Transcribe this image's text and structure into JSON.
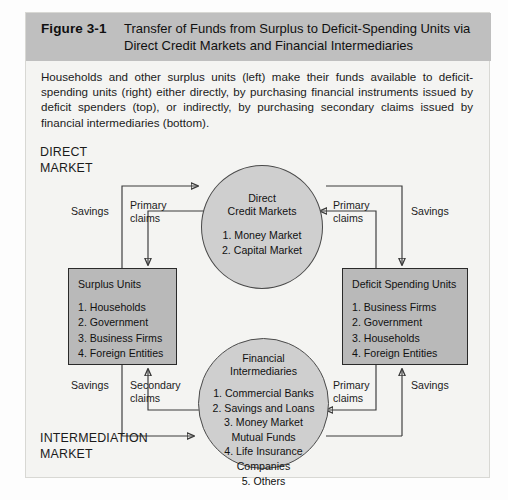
{
  "figure": {
    "label": "Figure 3-1",
    "title": "Transfer of Funds from Surplus to Deficit-Spending Units via Direct Credit Markets and Financial Intermediaries",
    "caption": "Households and other surplus units (left) make their funds available to deficit-spending units (right) either directly, by purchasing financial instruments issued by deficit spenders (top), or indirectly, by purchasing secondary claims issued by financial intermediaries (bottom)."
  },
  "colors": {
    "header_band": "#bfbfbf",
    "panel_background": "#f4f4f2",
    "box_fill": "#b9b9b9",
    "circle_fill": "#cfcfcf",
    "stroke": "#3a3a3a"
  },
  "diagram": {
    "markets": {
      "direct": "DIRECT\nMARKET",
      "intermediation": "INTERMEDIATION\nMARKET"
    },
    "nodes": {
      "direct_credit_markets": {
        "title": "Direct\nCredit Markets",
        "items": "1. Money Market\n2. Capital Market"
      },
      "financial_intermediaries": {
        "title": "Financial\nIntermediaries",
        "items": "1. Commercial Banks\n2. Savings and Loans\n3. Money Market\nMutual Funds\n4. Life Insurance\nCompanies\n5. Others"
      },
      "surplus_units": {
        "title": "Surplus Units",
        "items": "1. Households\n2. Government\n3. Business Firms\n4. Foreign Entities"
      },
      "deficit_spending_units": {
        "title": "Deficit Spending Units",
        "items": "1. Business Firms\n2. Government\n3. Households\n4. Foreign Entities"
      }
    },
    "edge_labels": {
      "top_left_savings": "Savings",
      "top_left_primary_claims": "Primary\nclaims",
      "top_right_primary_claims": "Primary\nclaims",
      "top_right_savings": "Savings",
      "bottom_left_savings": "Savings",
      "bottom_left_secondary_claims": "Secondary\nclaims",
      "bottom_right_primary_claims": "Primary\nclaims",
      "bottom_right_savings": "Savings"
    }
  }
}
